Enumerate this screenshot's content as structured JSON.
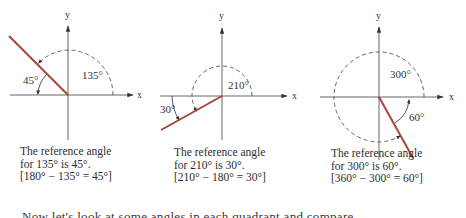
{
  "figure": {
    "panels": [
      {
        "axis_labels": {
          "x": "x",
          "y": "y"
        },
        "angle_label": "135°",
        "reference_label": "45°",
        "caption": {
          "line1": "The reference angle",
          "line2": "for 135° is 45°.",
          "line3": "[180° − 135° = 45°]"
        }
      },
      {
        "axis_labels": {
          "x": "x",
          "y": "y"
        },
        "angle_label": "210°",
        "reference_label": "30°",
        "caption": {
          "line1": "The reference angle",
          "line2": "for 210° is 30°.",
          "line3": "[210° − 180° = 30°]"
        }
      },
      {
        "axis_labels": {
          "x": "x",
          "y": "y"
        },
        "angle_label": "300°",
        "reference_label": "60°",
        "caption": {
          "line1": "The reference angle",
          "line2": "for 300° is 60°.",
          "line3": "[360° − 300° = 60°]"
        }
      }
    ],
    "terminal_side_color": "#a8443c",
    "axis_color": "#555555"
  },
  "body_text": {
    "cut_line": "Now let's look at some angles in each quadrant and compare"
  }
}
